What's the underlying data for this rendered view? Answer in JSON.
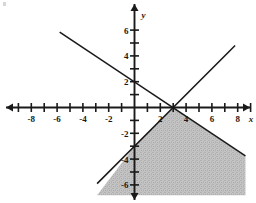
{
  "chart_data": {
    "type": "line",
    "title": "",
    "xlabel": "x",
    "ylabel": "y",
    "xlim": [
      -9,
      9
    ],
    "ylim": [
      -6.8,
      6.5
    ],
    "grid": false,
    "legend": false,
    "x_ticks": [
      -8,
      -6,
      -4,
      -2,
      2,
      4,
      6,
      8
    ],
    "y_ticks": [
      -6,
      -4,
      -2,
      2,
      4,
      6
    ],
    "x_tick_labels": [
      "-8",
      "-6",
      "-4",
      "-2",
      "2",
      "4",
      "6",
      "8"
    ],
    "y_tick_labels": [
      "-6",
      "-4",
      "-2",
      "2",
      "4",
      "6"
    ],
    "x_minor_ticks": [
      -9,
      -7,
      -5,
      -3,
      -1,
      1,
      3,
      5,
      7,
      9
    ],
    "y_minor_ticks": [
      -5,
      -3,
      -1,
      1,
      3,
      5
    ],
    "series": [
      {
        "name": "ascending-line",
        "equation": "y = x - 3",
        "slope": 1,
        "intercept": -3,
        "x_intercept": 3,
        "y_intercept": -3,
        "points": [
          [
            -2.9,
            -5.9
          ],
          [
            7.8,
            4.8
          ]
        ],
        "style": "solid",
        "color": "#1a1a1a"
      },
      {
        "name": "descending-line",
        "equation": "y = -2x/3 + 2",
        "slope": -0.6667,
        "intercept": 2,
        "x_intercept": 3,
        "y_intercept": 2,
        "points": [
          [
            -5.8,
            5.85
          ],
          [
            8.6,
            -3.75
          ]
        ],
        "style": "solid",
        "color": "#1a1a1a"
      }
    ],
    "intersection": [
      3,
      0
    ],
    "shaded_region": {
      "name": "solution-region",
      "description": "region below both lines",
      "fill": "#bdbdbd",
      "vertices": [
        [
          3,
          0
        ],
        [
          8.6,
          -3.75
        ],
        [
          8.6,
          -6.8
        ],
        [
          -2.9,
          -6.8
        ],
        [
          0,
          -3
        ]
      ]
    },
    "colors": {
      "axis": "#1a1a1a",
      "line": "#1a1a1a",
      "shade": "#bdbdbd",
      "background": "#ffffff"
    }
  }
}
